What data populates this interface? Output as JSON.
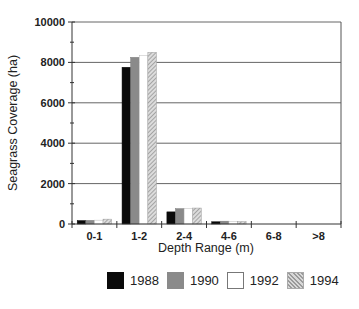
{
  "chart_data": {
    "type": "bar",
    "title": "",
    "xlabel": "Depth Range (m)",
    "ylabel": "Seagrass Coverage (ha)",
    "ylim": [
      0,
      10000
    ],
    "yticks": [
      0,
      2000,
      4000,
      6000,
      8000,
      10000
    ],
    "ytick_labels": [
      "0",
      "2000",
      "4000",
      "6000",
      "8000",
      "10000"
    ],
    "grid": "horizontal",
    "legend_position": "bottom",
    "categories": [
      "0-1",
      "1-2",
      "2-4",
      "4-6",
      "6-8",
      ">8"
    ],
    "series": [
      {
        "name": "1988",
        "color": "#0a0a0a",
        "values": [
          170,
          7760,
          600,
          110,
          0,
          0
        ]
      },
      {
        "name": "1990",
        "color": "#8a8a8a",
        "values": [
          180,
          8250,
          760,
          140,
          0,
          0
        ]
      },
      {
        "name": "1992",
        "color": "#ffffff",
        "values": [
          190,
          8350,
          780,
          130,
          0,
          0
        ]
      },
      {
        "name": "1994",
        "color": "hatched",
        "values": [
          240,
          8500,
          790,
          120,
          0,
          0
        ]
      }
    ]
  },
  "legend": {
    "items": [
      {
        "label": "1988"
      },
      {
        "label": "1990"
      },
      {
        "label": "1992"
      },
      {
        "label": "1994"
      }
    ]
  }
}
